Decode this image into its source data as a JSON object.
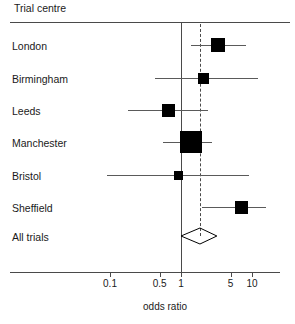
{
  "header": {
    "column_header": "Trial centre"
  },
  "axis": {
    "title": "odds ratio",
    "tick_labels": [
      "0.1",
      "0.5",
      "1",
      "5",
      "10"
    ],
    "tick_values": [
      0.1,
      0.5,
      1,
      5,
      10
    ]
  },
  "chart_data": {
    "type": "forest",
    "title": "",
    "xlabel": "odds ratio",
    "ylabel": "Trial centre",
    "scale": "log",
    "xlim": [
      0.055,
      17
    ],
    "grid": false,
    "legend": "none",
    "null_value": 1,
    "pooled_reference_line": 1.85,
    "categories": [
      "London",
      "Birmingham",
      "Leeds",
      "Manchester",
      "Bristol",
      "Sheffield",
      "All trials"
    ],
    "points": [
      {
        "label": "London",
        "odds_ratio": 3.3,
        "ci_low": 1.4,
        "ci_high": 8.2,
        "weight": 0.16,
        "marker": "square",
        "ci_clipped_right": false
      },
      {
        "label": "Birmingham",
        "odds_ratio": 2.1,
        "ci_low": 0.43,
        "ci_high": 12.0,
        "weight": 0.08,
        "marker": "square",
        "ci_clipped_right": false
      },
      {
        "label": "Leeds",
        "odds_ratio": 0.66,
        "ci_low": 0.18,
        "ci_high": 2.4,
        "weight": 0.13,
        "marker": "square",
        "ci_clipped_right": false
      },
      {
        "label": "Manchester",
        "odds_ratio": 1.4,
        "ci_low": 0.56,
        "ci_high": 2.7,
        "weight": 0.34,
        "marker": "square",
        "ci_clipped_right": false
      },
      {
        "label": "Bristol",
        "odds_ratio": 0.91,
        "ci_low": 0.09,
        "ci_high": 9.0,
        "weight": 0.05,
        "marker": "square",
        "ci_clipped_right": false
      },
      {
        "label": "Sheffield",
        "odds_ratio": 7.0,
        "ci_low": 1.98,
        "ci_high": 16.0,
        "weight": 0.14,
        "marker": "square",
        "ci_clipped_right": true
      },
      {
        "label": "All trials",
        "odds_ratio": 1.85,
        "ci_low": 1.0,
        "ci_high": 3.2,
        "weight": 1.0,
        "marker": "diamond",
        "ci_clipped_right": false
      }
    ]
  }
}
